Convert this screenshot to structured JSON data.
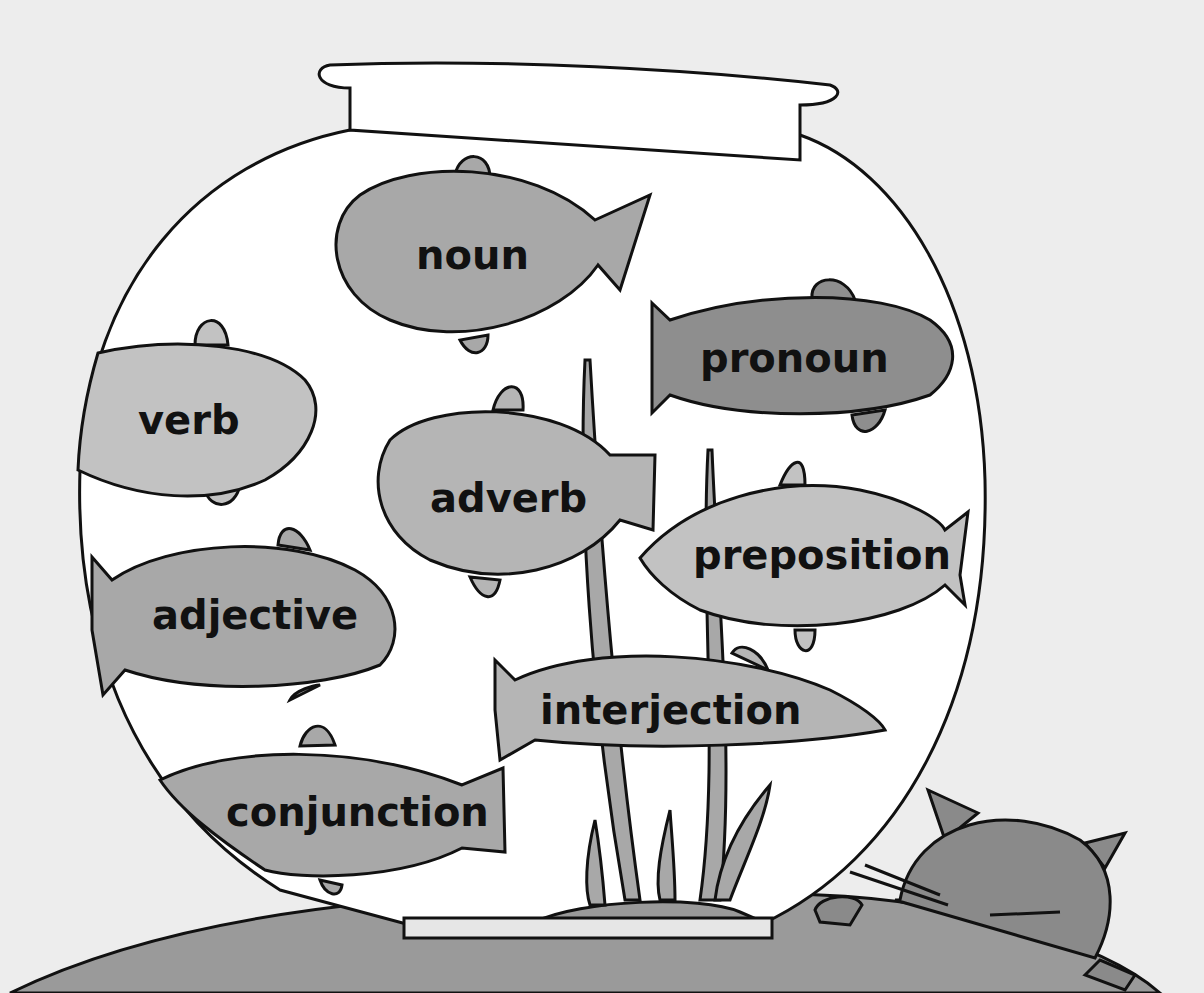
{
  "scene": {
    "subject": "fishbowl",
    "background_color": "#ededed",
    "bowl_color": "#ffffff",
    "outline_color": "#111111",
    "fish_colors": {
      "light": "#c2c2c2",
      "medium": "#a8a8a8",
      "dark": "#8e8e8e"
    },
    "table_color": "#9a9a9a",
    "cat_color": "#8a8a8a"
  },
  "fish": [
    {
      "label": "noun"
    },
    {
      "label": "pronoun"
    },
    {
      "label": "verb"
    },
    {
      "label": "adverb"
    },
    {
      "label": "preposition"
    },
    {
      "label": "adjective"
    },
    {
      "label": "interjection"
    },
    {
      "label": "conjunction"
    }
  ]
}
